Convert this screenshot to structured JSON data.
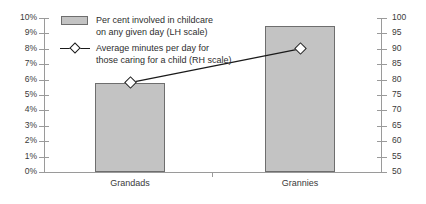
{
  "chart_data": {
    "type": "bar",
    "title": "",
    "xlabel": "",
    "categories": [
      "Grandads",
      "Grannies"
    ],
    "grid": false,
    "legend_position": "top-left",
    "series": [
      {
        "name": "Per cent involved in childcare on any given day (LH scale)",
        "type": "bar",
        "axis": "left",
        "values": [
          5.8,
          9.5
        ],
        "color": "#c3c3c3"
      },
      {
        "name": "Average minutes per day for those caring for a child (RH scale)",
        "type": "line",
        "axis": "right",
        "values": [
          79,
          90
        ],
        "color": "#1a1a1a",
        "marker": "diamond"
      }
    ],
    "left_axis": {
      "label": "",
      "ylim": [
        0,
        10
      ],
      "step": 1,
      "ticks": [
        "0%",
        "1%",
        "2%",
        "3%",
        "4%",
        "5%",
        "6%",
        "7%",
        "8%",
        "9%",
        "10%"
      ]
    },
    "right_axis": {
      "label": "",
      "ylim": [
        50,
        100
      ],
      "step": 5,
      "ticks": [
        "50",
        "55",
        "60",
        "65",
        "70",
        "75",
        "80",
        "85",
        "90",
        "95",
        "100"
      ]
    }
  },
  "legend": {
    "items": [
      {
        "key": "bar-swatch",
        "line1": "Per cent involved in childcare",
        "line2": "on any given day (LH scale)"
      },
      {
        "key": "line-marker",
        "line1": "Average minutes per day for",
        "line2": "those caring for a child (RH scale)"
      }
    ]
  }
}
